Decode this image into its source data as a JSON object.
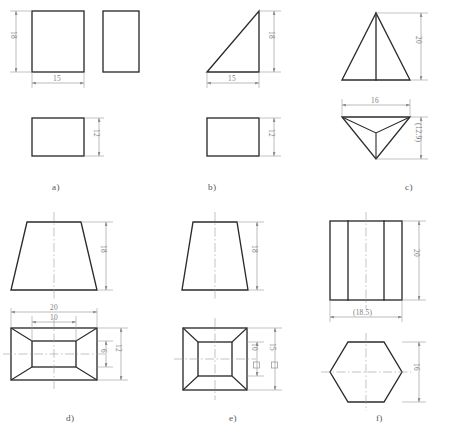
{
  "page": {
    "background_color": "#ffffff",
    "line_color": "#2b2b2b",
    "dimension_color": "#8f8f8f"
  },
  "figures": [
    {
      "id": "a",
      "caption": "a)",
      "description": "Rectangular prism (cuboid) — front view, side view and top view",
      "views": [
        "front",
        "side",
        "top"
      ],
      "dimensions": [
        {
          "label": "18",
          "orientation": "vertical",
          "view": "front",
          "meaning": "height"
        },
        {
          "label": "15",
          "orientation": "horizontal",
          "view": "front",
          "meaning": "width"
        },
        {
          "label": "12",
          "orientation": "vertical",
          "view": "top",
          "meaning": "depth"
        }
      ]
    },
    {
      "id": "b",
      "caption": "b)",
      "description": "Right triangular prism — front view and top view",
      "views": [
        "front",
        "top"
      ],
      "dimensions": [
        {
          "label": "18",
          "orientation": "vertical",
          "view": "front",
          "meaning": "height"
        },
        {
          "label": "15",
          "orientation": "horizontal",
          "view": "front",
          "meaning": "width"
        },
        {
          "label": "12",
          "orientation": "vertical",
          "view": "top",
          "meaning": "depth"
        }
      ]
    },
    {
      "id": "c",
      "caption": "c)",
      "description": "Triangular pyramid — front view and top view",
      "views": [
        "front",
        "top"
      ],
      "dimensions": [
        {
          "label": "20",
          "orientation": "vertical",
          "view": "front",
          "meaning": "height"
        },
        {
          "label": "16",
          "orientation": "horizontal",
          "view": "top",
          "meaning": "base width"
        },
        {
          "label": "(12.9)",
          "orientation": "vertical",
          "view": "top",
          "meaning": "reference depth"
        }
      ]
    },
    {
      "id": "d",
      "caption": "d)",
      "description": "Rectangular frustum (truncated pyramid) — front view and top view",
      "views": [
        "front",
        "top"
      ],
      "dimensions": [
        {
          "label": "18",
          "orientation": "vertical",
          "view": "front",
          "meaning": "height"
        },
        {
          "label": "20",
          "orientation": "horizontal",
          "view": "top",
          "meaning": "bottom width"
        },
        {
          "label": "10",
          "orientation": "horizontal",
          "view": "top",
          "meaning": "top width"
        },
        {
          "label": "6",
          "orientation": "vertical",
          "view": "top",
          "meaning": "top depth"
        },
        {
          "label": "12",
          "orientation": "vertical",
          "view": "top",
          "meaning": "bottom depth"
        }
      ]
    },
    {
      "id": "e",
      "caption": "e)",
      "description": "Square frustum (truncated square pyramid) — front view and top view",
      "views": [
        "front",
        "top"
      ],
      "dimensions": [
        {
          "label": "18",
          "orientation": "vertical",
          "view": "front",
          "meaning": "height"
        },
        {
          "label": "10",
          "orientation": "vertical",
          "view": "top",
          "meaning": "square top",
          "symbol": "square"
        },
        {
          "label": "15",
          "orientation": "vertical",
          "view": "top",
          "meaning": "square bottom",
          "symbol": "square"
        }
      ]
    },
    {
      "id": "f",
      "caption": "f)",
      "description": "Hexagonal prism — front view and top view",
      "views": [
        "front",
        "top"
      ],
      "dimensions": [
        {
          "label": "20",
          "orientation": "vertical",
          "view": "front",
          "meaning": "height"
        },
        {
          "label": "(18.5)",
          "orientation": "horizontal",
          "view": "front",
          "meaning": "reference across corners"
        },
        {
          "label": "16",
          "orientation": "vertical",
          "view": "top",
          "meaning": "across flats"
        }
      ]
    }
  ]
}
